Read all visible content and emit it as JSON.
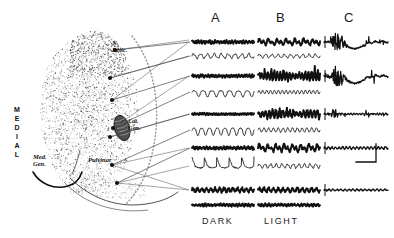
{
  "figure": {
    "background_color": "#ffffff",
    "ink_color": "#111111",
    "stipple_color": "#4a4a4a"
  },
  "anatomy": {
    "orientation_label": "MEDIAL",
    "orientation_letters": [
      "M",
      "E",
      "D",
      "I",
      "A",
      "L"
    ],
    "structures": [
      {
        "id": "n-retic",
        "label_lines": [
          "N.",
          "Retic."
        ],
        "label": "N. Retic.",
        "x": 112,
        "y": 44
      },
      {
        "id": "lat-gen",
        "label_lines": [
          "Lat.",
          "Gen."
        ],
        "label": "Lat. Gen.",
        "x": 128,
        "y": 122
      },
      {
        "id": "pulvinar",
        "label_lines": [
          "Pulvinar"
        ],
        "label": "Pulvinar",
        "x": 88,
        "y": 160
      },
      {
        "id": "med-gen",
        "label_lines": [
          "Med.",
          "Gen."
        ],
        "label": "Med. Gen.",
        "x": 36,
        "y": 157
      }
    ],
    "recording_sites": [
      {
        "id": "site-1",
        "x": 115,
        "y": 50,
        "row": 0
      },
      {
        "id": "site-2",
        "x": 110,
        "y": 78,
        "row": 1
      },
      {
        "id": "site-3",
        "x": 112,
        "y": 100,
        "row": 2
      },
      {
        "id": "site-4",
        "x": 113,
        "y": 128,
        "row": 3
      },
      {
        "id": "site-5",
        "x": 110,
        "y": 137,
        "row": 4
      },
      {
        "id": "site-6",
        "x": 112,
        "y": 165,
        "row": 5
      },
      {
        "id": "site-7",
        "x": 117,
        "y": 183,
        "row": 6
      }
    ]
  },
  "columns": [
    {
      "id": "col-a",
      "header": "A",
      "header_x": 215,
      "condition": "DARK",
      "condition_x": 204,
      "x": 192,
      "width": 62
    },
    {
      "id": "col-b",
      "header": "B",
      "header_x": 280,
      "condition": "LIGHT",
      "condition_x": 265,
      "x": 258,
      "width": 62
    },
    {
      "id": "col-c",
      "header": "C",
      "header_x": 348,
      "condition": "",
      "condition_x": 0,
      "x": 324,
      "width": 64
    }
  ],
  "labels": {
    "dark": "DARK",
    "light": "LIGHT",
    "header_a": "A",
    "header_b": "B",
    "header_c": "C"
  },
  "calibration": {
    "id": "calibration-bar",
    "x": 356,
    "y": 162,
    "horizontal_length": 20,
    "vertical_length": 18
  },
  "chart_data": {
    "type": "line",
    "title": "",
    "xlabel": "",
    "ylabel": "",
    "trace_rows": [
      {
        "row": 0,
        "y": 42,
        "traces": [
          {
            "column": "A",
            "kind": "thick-tonic",
            "amplitude": 3.0,
            "freq": 22,
            "spiky": false
          },
          {
            "column": "B",
            "kind": "thick-burst",
            "amplitude": 4.0,
            "freq": 14,
            "spiky": false
          },
          {
            "column": "C",
            "kind": "evoked-spike",
            "amplitude": 9.0,
            "freq": 30,
            "spiky": true
          }
        ]
      },
      {
        "row": 1,
        "y": 56,
        "traces": [
          {
            "column": "A",
            "kind": "thin-wave",
            "amplitude": 4.0,
            "freq": 9,
            "spiky": false
          },
          {
            "column": "B",
            "kind": "thin-wave",
            "amplitude": 3.0,
            "freq": 10,
            "spiky": false
          }
        ]
      },
      {
        "row": 2,
        "y": 76,
        "traces": [
          {
            "column": "A",
            "kind": "thick-tonic",
            "amplitude": 2.5,
            "freq": 24,
            "spiky": false
          },
          {
            "column": "B",
            "kind": "thick-spindle",
            "amplitude": 7.0,
            "freq": 20,
            "spiky": true
          },
          {
            "column": "C",
            "kind": "evoked-spike",
            "amplitude": 10.0,
            "freq": 26,
            "spiky": true
          }
        ]
      },
      {
        "row": 3,
        "y": 92,
        "traces": [
          {
            "column": "A",
            "kind": "thin-dip",
            "amplitude": 5.0,
            "freq": 7,
            "spiky": false
          },
          {
            "column": "B",
            "kind": "thin-ripple",
            "amplitude": 3.0,
            "freq": 16,
            "spiky": false
          }
        ]
      },
      {
        "row": 4,
        "y": 114,
        "traces": [
          {
            "column": "A",
            "kind": "thick-tonic",
            "amplitude": 2.0,
            "freq": 26,
            "spiky": false
          },
          {
            "column": "B",
            "kind": "thick-spindle",
            "amplitude": 6.0,
            "freq": 18,
            "spiky": true
          },
          {
            "column": "C",
            "kind": "evoked-small",
            "amplitude": 5.0,
            "freq": 22,
            "spiky": true
          }
        ]
      },
      {
        "row": 5,
        "y": 130,
        "traces": [
          {
            "column": "A",
            "kind": "thin-slowwave",
            "amplitude": 5.5,
            "freq": 8,
            "spiky": false
          },
          {
            "column": "B",
            "kind": "thin-ripple",
            "amplitude": 3.5,
            "freq": 13,
            "spiky": false
          }
        ]
      },
      {
        "row": 6,
        "y": 148,
        "traces": [
          {
            "column": "A",
            "kind": "thick-tonic",
            "amplitude": 3.0,
            "freq": 18,
            "spiky": false
          },
          {
            "column": "B",
            "kind": "thick-burst",
            "amplitude": 4.5,
            "freq": 15,
            "spiky": false
          },
          {
            "column": "C",
            "kind": "evoked-flat",
            "amplitude": 3.5,
            "freq": 18,
            "spiky": false
          }
        ]
      },
      {
        "row": 7,
        "y": 166,
        "traces": [
          {
            "column": "A",
            "kind": "thin-deepdip",
            "amplitude": 9.0,
            "freq": 5,
            "spiky": false
          },
          {
            "column": "B",
            "kind": "thin-wave",
            "amplitude": 3.5,
            "freq": 11,
            "spiky": false
          }
        ]
      },
      {
        "row": 8,
        "y": 190,
        "traces": [
          {
            "column": "A",
            "kind": "thick-mixed",
            "amplitude": 3.5,
            "freq": 14,
            "spiky": false
          },
          {
            "column": "B",
            "kind": "thick-mixed",
            "amplitude": 3.5,
            "freq": 13,
            "spiky": false
          },
          {
            "column": "C",
            "kind": "evoked-flat",
            "amplitude": 2.5,
            "freq": 16,
            "spiky": false
          }
        ]
      },
      {
        "row": 9,
        "y": 205,
        "traces": [
          {
            "column": "A",
            "kind": "thick-tonic",
            "amplitude": 2.5,
            "freq": 20,
            "spiky": false
          },
          {
            "column": "B",
            "kind": "thick-tonic",
            "amplitude": 2.5,
            "freq": 19,
            "spiky": false
          }
        ]
      }
    ]
  }
}
